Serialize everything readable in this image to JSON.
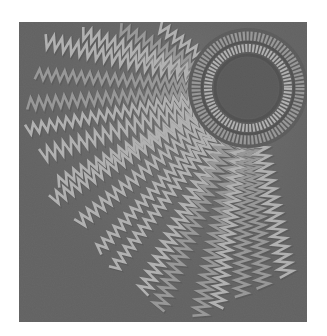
{
  "image": {
    "description": "Grayscale photograph of zigzag machine embroidery on fabric forming a sunburst: a stitched circle with concentric satin rings at upper right and radiating zigzag rays fanning toward the lower left.",
    "colors": {
      "page_background": "#ffffff",
      "fabric": "#5a5a5a",
      "fabric_dark": "#4a4a4a",
      "thread_light": "#e6e6e6",
      "thread_mid": "#b8b8b8",
      "thread_dark": "#3a3a3a"
    },
    "frame": {
      "x": 19,
      "y": 22,
      "width": 288,
      "height": 300
    },
    "circle": {
      "cx": 229,
      "cy": 66,
      "inner_radius": 30,
      "ring1_radius": 40,
      "ring2_radius": 52
    },
    "rays": [
      {
        "x": 22,
        "y": 18
      },
      {
        "x": 16,
        "y": 52
      },
      {
        "x": 6,
        "y": 82
      },
      {
        "x": 6,
        "y": 108
      },
      {
        "x": 20,
        "y": 134
      },
      {
        "x": 36,
        "y": 162
      },
      {
        "x": 30,
        "y": 180
      },
      {
        "x": 56,
        "y": 204
      },
      {
        "x": 76,
        "y": 232
      },
      {
        "x": 92,
        "y": 250
      },
      {
        "x": 122,
        "y": 274
      },
      {
        "x": 138,
        "y": 290
      },
      {
        "x": 180,
        "y": 296
      },
      {
        "x": 198,
        "y": 288
      },
      {
        "x": 222,
        "y": 278
      },
      {
        "x": 244,
        "y": 268
      },
      {
        "x": 268,
        "y": 256
      },
      {
        "x": 60,
        "y": 10
      },
      {
        "x": 100,
        "y": 6
      },
      {
        "x": 140,
        "y": 4
      }
    ]
  }
}
